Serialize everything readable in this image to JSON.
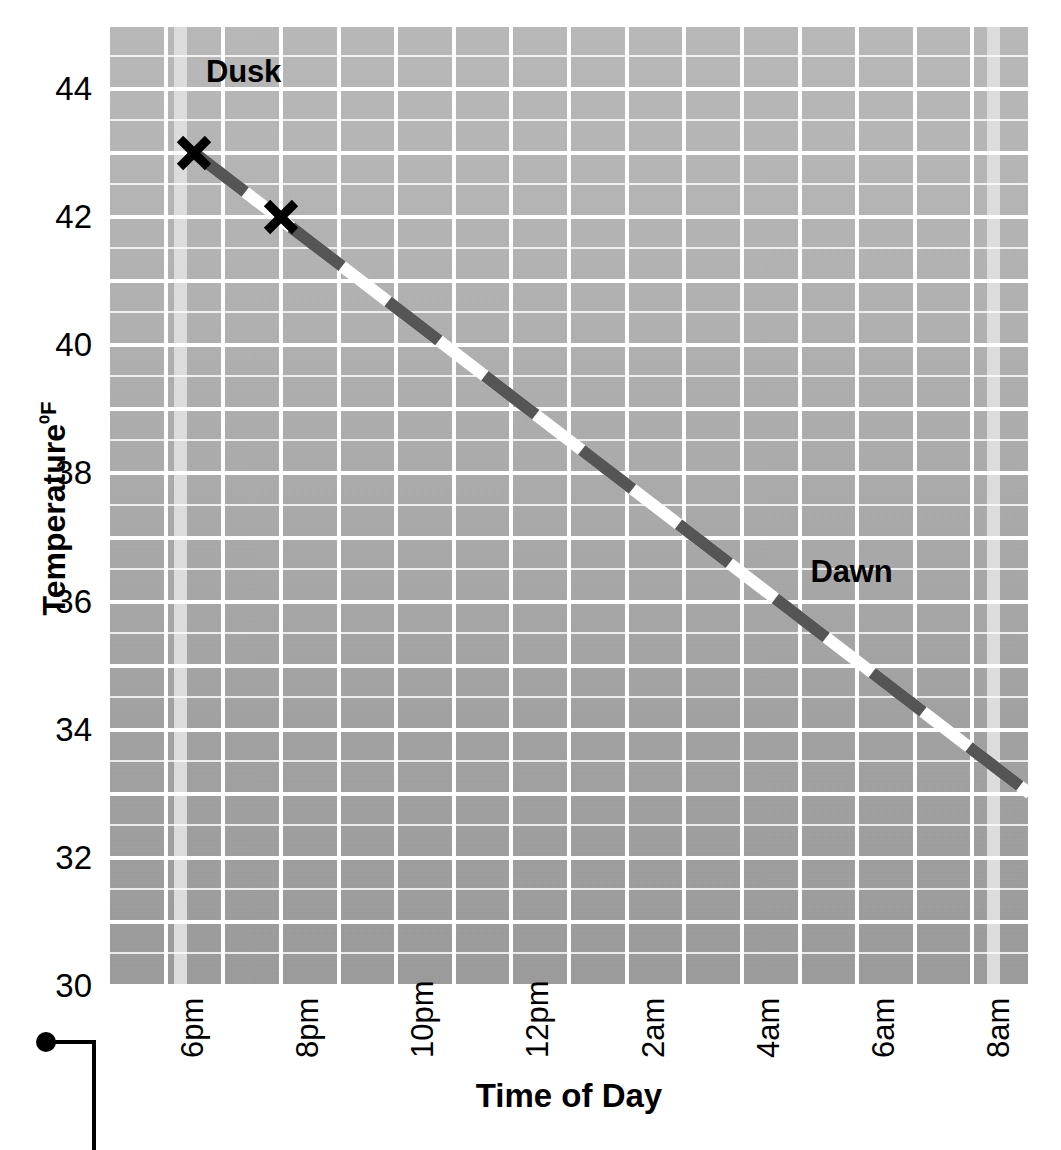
{
  "chart_data": {
    "type": "line",
    "title": "",
    "xlabel": "Time of Day",
    "ylabel": "Temperature ⁰F",
    "ylabel_text": "Temperature",
    "ylabel_unit": "⁰F",
    "ylim": [
      30,
      45
    ],
    "yticks": [
      30,
      32,
      34,
      36,
      38,
      40,
      42,
      44
    ],
    "ytick_labels": [
      "30",
      "32",
      "34",
      "36",
      "38",
      "40",
      "42",
      "44"
    ],
    "xtick_labels": [
      "6pm",
      "8pm",
      "10pm",
      "12pm",
      "2am",
      "4am",
      "6am",
      "8am"
    ],
    "xticks_hours": [
      18,
      20,
      22,
      24,
      26,
      28,
      30,
      32
    ],
    "xlim_hours": [
      17,
      33
    ],
    "grid": true,
    "grid_color": "#ffffff",
    "legend": "none",
    "line_style": "dashed",
    "line_colors": [
      "#555555",
      "#ffffff"
    ],
    "line_width_px": 12,
    "series": [
      {
        "name": "Nighttime cooling",
        "x_hours": [
          18.5,
          33.0
        ],
        "y_values": [
          43.0,
          33.0
        ],
        "points": [
          {
            "x_label": "6:30pm",
            "x_hours": 18.5,
            "y": 43.0
          },
          {
            "x_label": "8:20am",
            "x_hours": 33.0,
            "y": 33.0
          }
        ]
      }
    ],
    "markers": [
      {
        "label": "marker-1",
        "x_hours": 18.5,
        "y": 43.0,
        "shape": "x",
        "color": "#000000"
      },
      {
        "label": "marker-2",
        "x_hours": 20.0,
        "y": 42.0,
        "shape": "x",
        "color": "#000000"
      }
    ],
    "annotations": [
      {
        "text": "Dusk",
        "x_hours": 18.7,
        "y": 44.3,
        "band_x_hours": 18.25
      },
      {
        "text": "Dawn",
        "x_hours": 31.1,
        "y": 36.5,
        "band_x_hours": 32.35
      }
    ],
    "vertical_bands": [
      {
        "name": "dusk-band",
        "x_hours": 18.25,
        "color": "#dcdcdc"
      },
      {
        "name": "dawn-band",
        "x_hours": 32.35,
        "color": "#dcdcdc"
      }
    ],
    "plot_background": "#ababab",
    "axis_text_color": "#000000"
  },
  "axes": {
    "y_title": "Temperature",
    "y_unit": "⁰F",
    "x_title": "Time of Day"
  },
  "labels": {
    "dusk": "Dusk",
    "dawn": "Dawn"
  }
}
